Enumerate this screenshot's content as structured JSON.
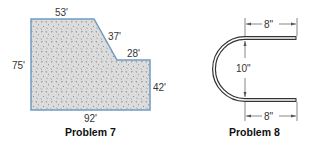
{
  "problem7": {
    "caption": "Problem 7",
    "dimensions": {
      "top": "53'",
      "diagonal": "37'",
      "step": "28'",
      "left": "75'",
      "right": "42'",
      "bottom": "92'"
    },
    "colors": {
      "fill": "#d9d9d9",
      "outline": "#6f9cc3",
      "speckle": "#555555"
    }
  },
  "problem8": {
    "caption": "Problem 8",
    "dimensions": {
      "top_arm": "8\"",
      "gap": "10\"",
      "bottom_arm": "8\""
    },
    "colors": {
      "rod": "#333333",
      "rod_inner": "#ffffff"
    }
  }
}
